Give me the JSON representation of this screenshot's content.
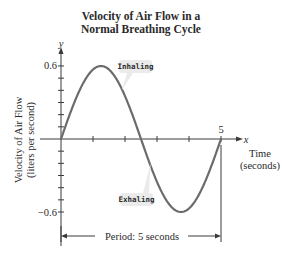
{
  "chart_data": {
    "type": "line",
    "title": "Velocity of Air Flow in a Normal Breathing Cycle",
    "title_lines": [
      "Velocity of Air Flow in a",
      "Normal Breathing Cycle"
    ],
    "xlabel": "Time (seconds)",
    "xlabel_lines": [
      "Time",
      "(seconds)"
    ],
    "ylabel": "Velocity of Air Flow (liters per second)",
    "ylabel_lines": [
      "Velocity of Air Flow",
      "(liters per second)"
    ],
    "x_axis_symbol": "x",
    "y_axis_symbol": "y",
    "function": "y = 0.6 sin(2πt/5)",
    "xlim": [
      0,
      5
    ],
    "ylim": [
      -0.6,
      0.6
    ],
    "x_ticks": [
      1,
      2,
      3,
      4,
      5
    ],
    "x_tick_labels": [
      {
        "value": 5,
        "label": "5"
      }
    ],
    "y_ticks": [
      -0.6,
      -0.5,
      -0.4,
      -0.3,
      -0.2,
      -0.1,
      0.1,
      0.2,
      0.3,
      0.4,
      0.5,
      0.6
    ],
    "y_tick_labels": [
      {
        "value": 0.6,
        "label": "0.6"
      },
      {
        "value": -0.6,
        "label": "−0.6"
      }
    ],
    "grid": false,
    "series": [
      {
        "name": "Air flow velocity",
        "color": "#6b6b6b",
        "x": [
          0,
          0.25,
          0.5,
          0.75,
          1,
          1.25,
          1.5,
          1.75,
          2,
          2.25,
          2.5,
          2.75,
          3,
          3.25,
          3.5,
          3.75,
          4,
          4.25,
          4.5,
          4.75,
          5
        ],
        "values": [
          0,
          0.185,
          0.353,
          0.485,
          0.571,
          0.6,
          0.571,
          0.485,
          0.353,
          0.185,
          0,
          -0.185,
          -0.353,
          -0.485,
          -0.571,
          -0.6,
          -0.571,
          -0.485,
          -0.353,
          -0.185,
          0
        ]
      }
    ],
    "annotations": [
      {
        "text": "Inhaling",
        "points_to": {
          "x": 1.9,
          "y": 0.4
        }
      },
      {
        "text": "Exhaling",
        "points_to": {
          "x": 2.8,
          "y": -0.2
        }
      },
      {
        "text": "Period: 5 seconds",
        "spans": [
          0,
          5
        ]
      }
    ]
  },
  "colors": {
    "curve": "#6b6b6b",
    "axes": "#3a3a3a",
    "callout_bg": "#ebebeb",
    "text": "#2a2a2a"
  }
}
